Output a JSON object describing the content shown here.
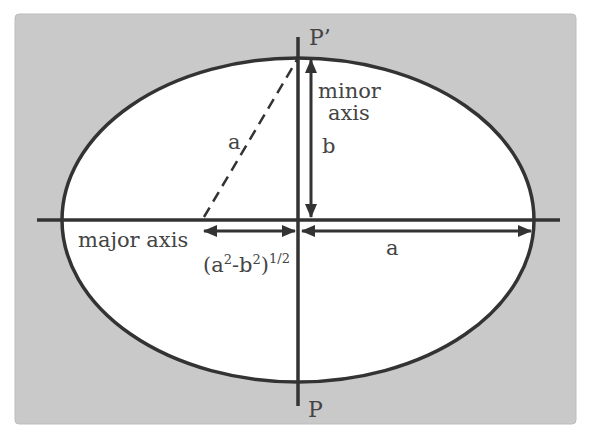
{
  "diagram": {
    "type": "ellipse-geometry",
    "colors": {
      "page_background": "#ffffff",
      "frame_fill": "#c9c9c9",
      "frame_stroke": "#bdbdbd",
      "ellipse_fill": "#ffffff",
      "stroke": "#333333",
      "label": "#444444"
    },
    "labels": {
      "top_point": "P’",
      "bottom_point": "P",
      "minor_axis_line1": "minor",
      "minor_axis_line2": "axis",
      "semi_minor": "b",
      "hypotenuse": "a",
      "major_axis": "major axis",
      "focal_distance_base": "(a",
      "focal_distance_sup1": "2",
      "focal_distance_mid": "-b",
      "focal_distance_sup2": "2",
      "focal_distance_close": ")",
      "focal_distance_sup3": "1/2",
      "semi_major": "a"
    }
  }
}
